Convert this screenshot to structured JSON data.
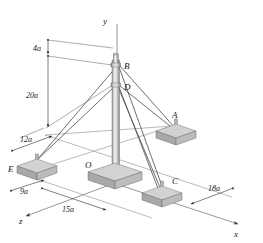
{
  "figure": {
    "background_color": "#ffffff",
    "line_color": "#4a4a4a",
    "block_fill": "#d2d2d2",
    "block_shade": "#a8a8a8"
  },
  "axes": [
    {
      "id": "y-axis",
      "label": "y"
    },
    {
      "id": "x-axis",
      "label": "x"
    },
    {
      "id": "z-axis",
      "label": "z"
    }
  ],
  "points": [
    {
      "id": "point-a",
      "label": "A"
    },
    {
      "id": "point-b",
      "label": "B"
    },
    {
      "id": "point-c",
      "label": "C"
    },
    {
      "id": "point-d",
      "label": "D"
    },
    {
      "id": "point-e",
      "label": "E"
    },
    {
      "id": "point-o",
      "label": "O"
    }
  ],
  "dimensions": [
    {
      "id": "dim-4a",
      "label": "4a"
    },
    {
      "id": "dim-20a",
      "label": "20a"
    },
    {
      "id": "dim-12a",
      "label": "12a"
    },
    {
      "id": "dim-9a",
      "label": "9a"
    },
    {
      "id": "dim-15a",
      "label": "15a"
    },
    {
      "id": "dim-18a",
      "label": "18a"
    }
  ]
}
